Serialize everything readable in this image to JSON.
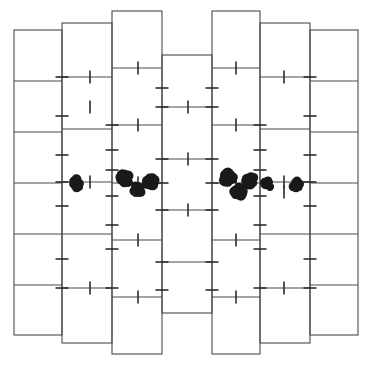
{
  "figure": {
    "type": "schematic-diagram",
    "width": 372,
    "height": 367,
    "background_color": "#ffffff",
    "line_color": "#4a4a4a",
    "tick_color": "#2b2b2b",
    "dot_color": "#1a1a1a",
    "line_width": 1.1,
    "tick_width": 1.6
  },
  "geometry": {
    "column_x_edges": [
      14,
      62,
      112,
      162,
      212,
      260,
      310,
      358
    ],
    "column_count": 7,
    "columns": [
      {
        "index": 1,
        "name": "column-1",
        "x0": 14,
        "x1": 62,
        "y_top": 30,
        "y_bottom": 335,
        "row_edges": [
          30,
          81,
          132,
          183,
          234,
          285,
          335
        ],
        "row_count": 6
      },
      {
        "index": 2,
        "name": "column-2",
        "x0": 62,
        "x1": 112,
        "y_top": 23,
        "y_bottom": 343,
        "row_edges": [
          23,
          77,
          129,
          182,
          234,
          288,
          343
        ],
        "row_count": 6
      },
      {
        "index": 3,
        "name": "column-3",
        "x0": 112,
        "x1": 162,
        "y_top": 11,
        "y_bottom": 354,
        "row_edges": [
          11,
          68,
          125,
          183,
          240,
          297,
          354
        ],
        "row_count": 6
      },
      {
        "index": 4,
        "name": "column-4",
        "x0": 162,
        "x1": 212,
        "y_top": 55,
        "y_bottom": 313,
        "row_edges": [
          55,
          107,
          159,
          210,
          262,
          313
        ],
        "row_count": 5
      },
      {
        "index": 5,
        "name": "column-5",
        "x0": 212,
        "x1": 260,
        "y_top": 11,
        "y_bottom": 354,
        "row_edges": [
          11,
          68,
          125,
          183,
          240,
          297,
          354
        ],
        "row_count": 6
      },
      {
        "index": 6,
        "name": "column-6",
        "x0": 260,
        "x1": 310,
        "y_top": 23,
        "y_bottom": 343,
        "row_edges": [
          23,
          77,
          129,
          182,
          234,
          288,
          343
        ],
        "row_count": 6
      },
      {
        "index": 7,
        "name": "column-7",
        "x0": 310,
        "x1": 358,
        "y_top": 30,
        "y_bottom": 335,
        "row_edges": [
          30,
          81,
          132,
          183,
          234,
          285,
          335
        ],
        "row_count": 6
      }
    ]
  },
  "ticks": {
    "description": "Short perpendicular marks. Horizontal ticks straddle the vertical column borders; vertical ticks straddle the horizontal row edges.",
    "horizontal_length": 13,
    "vertical_length": 13,
    "horizontal": [
      {
        "x": 62,
        "y": 77
      },
      {
        "x": 62,
        "y": 116
      },
      {
        "x": 62,
        "y": 155
      },
      {
        "x": 62,
        "y": 182
      },
      {
        "x": 62,
        "y": 206
      },
      {
        "x": 62,
        "y": 259
      },
      {
        "x": 62,
        "y": 288
      },
      {
        "x": 112,
        "y": 125
      },
      {
        "x": 112,
        "y": 150
      },
      {
        "x": 112,
        "y": 170
      },
      {
        "x": 112,
        "y": 196
      },
      {
        "x": 112,
        "y": 225
      },
      {
        "x": 112,
        "y": 249
      },
      {
        "x": 112,
        "y": 288
      },
      {
        "x": 162,
        "y": 88
      },
      {
        "x": 162,
        "y": 107
      },
      {
        "x": 162,
        "y": 159
      },
      {
        "x": 162,
        "y": 183
      },
      {
        "x": 162,
        "y": 210
      },
      {
        "x": 162,
        "y": 262
      },
      {
        "x": 162,
        "y": 290
      },
      {
        "x": 212,
        "y": 88
      },
      {
        "x": 212,
        "y": 107
      },
      {
        "x": 212,
        "y": 159
      },
      {
        "x": 212,
        "y": 183
      },
      {
        "x": 212,
        "y": 210
      },
      {
        "x": 212,
        "y": 262
      },
      {
        "x": 212,
        "y": 290
      },
      {
        "x": 260,
        "y": 125
      },
      {
        "x": 260,
        "y": 150
      },
      {
        "x": 260,
        "y": 170
      },
      {
        "x": 260,
        "y": 196
      },
      {
        "x": 260,
        "y": 225
      },
      {
        "x": 260,
        "y": 249
      },
      {
        "x": 260,
        "y": 288
      },
      {
        "x": 310,
        "y": 77
      },
      {
        "x": 310,
        "y": 116
      },
      {
        "x": 310,
        "y": 155
      },
      {
        "x": 310,
        "y": 182
      },
      {
        "x": 310,
        "y": 206
      },
      {
        "x": 310,
        "y": 259
      },
      {
        "x": 310,
        "y": 288
      }
    ],
    "vertical": [
      {
        "x": 90,
        "y": 77
      },
      {
        "x": 90,
        "y": 182
      },
      {
        "x": 90,
        "y": 288
      },
      {
        "x": 90,
        "y": 107
      },
      {
        "x": 138,
        "y": 68
      },
      {
        "x": 138,
        "y": 125
      },
      {
        "x": 138,
        "y": 183
      },
      {
        "x": 138,
        "y": 240
      },
      {
        "x": 138,
        "y": 297
      },
      {
        "x": 236,
        "y": 68
      },
      {
        "x": 236,
        "y": 125
      },
      {
        "x": 236,
        "y": 183
      },
      {
        "x": 236,
        "y": 240
      },
      {
        "x": 236,
        "y": 297
      },
      {
        "x": 284,
        "y": 77
      },
      {
        "x": 284,
        "y": 182
      },
      {
        "x": 284,
        "y": 192
      },
      {
        "x": 284,
        "y": 288
      },
      {
        "x": 188,
        "y": 159
      },
      {
        "x": 188,
        "y": 210
      },
      {
        "x": 188,
        "y": 107
      }
    ]
  },
  "clusters": {
    "description": "Eight irregular dark blobs (overlapping filled circles) arranged in two mirrored groups left and right of the diagram midline, all near y = 180-198.",
    "count": 8,
    "items": [
      {
        "id": "cluster-1",
        "cx": 77,
        "cy": 184,
        "r": 6.0,
        "group": "left"
      },
      {
        "id": "cluster-2",
        "cx": 124,
        "cy": 179,
        "r": 7.0,
        "group": "left"
      },
      {
        "id": "cluster-3",
        "cx": 150,
        "cy": 181,
        "r": 6.5,
        "group": "left"
      },
      {
        "id": "cluster-4",
        "cx": 138,
        "cy": 190,
        "r": 6.0,
        "group": "left"
      },
      {
        "id": "cluster-5",
        "cx": 228,
        "cy": 178,
        "r": 7.0,
        "group": "right"
      },
      {
        "id": "cluster-6",
        "cx": 250,
        "cy": 180,
        "r": 6.5,
        "group": "right"
      },
      {
        "id": "cluster-7",
        "cx": 239,
        "cy": 192,
        "r": 6.5,
        "group": "right"
      },
      {
        "id": "cluster-8",
        "cx": 267,
        "cy": 184,
        "r": 5.0,
        "group": "right"
      },
      {
        "id": "cluster-9",
        "cx": 297,
        "cy": 184,
        "r": 5.5,
        "group": "right"
      }
    ]
  }
}
